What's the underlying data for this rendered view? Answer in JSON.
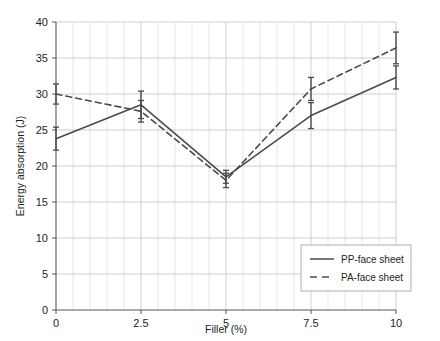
{
  "chart_data": {
    "type": "line",
    "title": "",
    "xlabel": "Filler (%)",
    "ylabel": "Energy absorption (J)",
    "x": [
      0,
      2.5,
      5,
      7.5,
      10
    ],
    "xlim": [
      0,
      10
    ],
    "ylim": [
      0,
      40
    ],
    "xticks": [
      "0",
      "2.5",
      "5",
      "7.5",
      "10"
    ],
    "yticks": [
      "0",
      "5",
      "10",
      "15",
      "20",
      "25",
      "30",
      "35",
      "40"
    ],
    "grid": "major horizontal, minor vertical every 0.5",
    "legend_position": "lower right inside axes",
    "series": [
      {
        "name": "PP-face sheet",
        "style": "solid",
        "color": "#4a4a52",
        "values": [
          23.8,
          28.5,
          18.5,
          27.0,
          32.3
        ],
        "errors": [
          1.6,
          1.9,
          0.9,
          1.8,
          1.6
        ]
      },
      {
        "name": "PA-face sheet",
        "style": "dashed",
        "color": "#4a4a52",
        "values": [
          30.0,
          27.6,
          18.0,
          30.7,
          36.4
        ],
        "errors": [
          1.4,
          1.5,
          1.0,
          1.6,
          2.2
        ]
      }
    ]
  },
  "axes": {
    "x_title": "Filler (%)",
    "y_title": "Energy absorption (J)",
    "x_tick_labels": [
      "0",
      "2.5",
      "5",
      "7.5",
      "10"
    ],
    "y_tick_labels": [
      "0",
      "5",
      "10",
      "15",
      "20",
      "25",
      "30",
      "35",
      "40"
    ]
  },
  "legend": {
    "entries": [
      {
        "label": "PP-face sheet",
        "style": "solid"
      },
      {
        "label": "PA-face sheet",
        "style": "dashed"
      }
    ]
  },
  "colors": {
    "line": "#4a4a52",
    "grid_major": "#c9c9cf",
    "grid_minor": "#dcdce1",
    "axis": "#58585f",
    "text": "#231f20",
    "background": "#ffffff"
  }
}
